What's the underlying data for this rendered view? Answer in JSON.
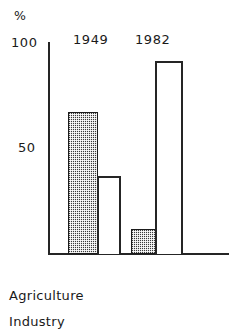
{
  "chart_data": {
    "type": "bar",
    "title": "",
    "subtitle": "",
    "xlabel": "",
    "ylabel": "%",
    "unit_label": "%",
    "ylim": [
      0,
      100
    ],
    "y_ticks": [
      "100",
      "50"
    ],
    "y_tick_values": [
      100,
      50
    ],
    "grid": false,
    "legend_position": "below",
    "categories": [
      "1949",
      "1982"
    ],
    "series": [
      {
        "name": "Agriculture",
        "style": "filled",
        "values": [
          67,
          12
        ]
      },
      {
        "name": "Industry",
        "style": "outline",
        "values": [
          37,
          91
        ]
      }
    ],
    "legend": [
      "Agriculture",
      "Industry"
    ],
    "annotations": []
  },
  "axis": {
    "unit": "%",
    "tick_top": "100",
    "tick_mid": "50"
  },
  "groups": [
    {
      "label": "1949"
    },
    {
      "label": "1982"
    }
  ],
  "legend": {
    "items": [
      {
        "label": "Agriculture"
      },
      {
        "label": "Industry"
      }
    ]
  }
}
